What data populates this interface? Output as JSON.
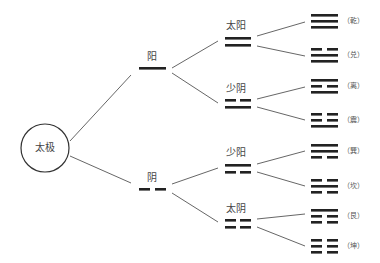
{
  "diagram": {
    "root": {
      "label": "太极"
    },
    "two_forms": [
      {
        "label": "阳",
        "lines": [
          "solid"
        ]
      },
      {
        "label": "阴",
        "lines": [
          "broken"
        ]
      }
    ],
    "four_images": [
      {
        "label": "太阳",
        "lines_top_to_bottom": [
          "solid",
          "solid"
        ]
      },
      {
        "label": "少阴",
        "lines_top_to_bottom": [
          "broken",
          "solid"
        ]
      },
      {
        "label": "少阳",
        "lines_top_to_bottom": [
          "solid",
          "broken"
        ]
      },
      {
        "label": "太阴",
        "lines_top_to_bottom": [
          "broken",
          "broken"
        ]
      }
    ],
    "eight_trigrams": [
      {
        "label": "（乾）",
        "lines_top_to_bottom": [
          "solid",
          "solid",
          "solid"
        ]
      },
      {
        "label": "（兑）",
        "lines_top_to_bottom": [
          "broken",
          "solid",
          "solid"
        ]
      },
      {
        "label": "（离）",
        "lines_top_to_bottom": [
          "solid",
          "broken",
          "solid"
        ]
      },
      {
        "label": "（震）",
        "lines_top_to_bottom": [
          "broken",
          "broken",
          "solid"
        ]
      },
      {
        "label": "（巽）",
        "lines_top_to_bottom": [
          "solid",
          "solid",
          "broken"
        ]
      },
      {
        "label": "（坎）",
        "lines_top_to_bottom": [
          "broken",
          "solid",
          "broken"
        ]
      },
      {
        "label": "（艮）",
        "lines_top_to_bottom": [
          "solid",
          "broken",
          "broken"
        ]
      },
      {
        "label": "（坤）",
        "lines_top_to_bottom": [
          "broken",
          "broken",
          "broken"
        ]
      }
    ],
    "colors": {
      "line": "#222222",
      "connector": "#444444",
      "text": "#444444"
    }
  }
}
